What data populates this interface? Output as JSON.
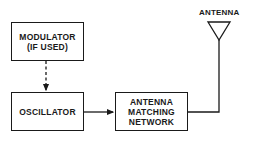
{
  "diagram": {
    "type": "block-diagram",
    "blocks": [
      {
        "id": "modulator",
        "lines": [
          "MODULATOR",
          "(IF USED)"
        ]
      },
      {
        "id": "oscillator",
        "lines": [
          "OSCILLATOR"
        ]
      },
      {
        "id": "matching_network",
        "lines": [
          "ANTENNA",
          "MATCHING",
          "NETWORK"
        ]
      }
    ],
    "antenna": {
      "label": "ANTENNA"
    },
    "connections": [
      {
        "from": "modulator",
        "to": "oscillator",
        "style": "dashed-arrow"
      },
      {
        "from": "oscillator",
        "to": "matching_network",
        "style": "solid-arrow"
      },
      {
        "from": "matching_network",
        "to": "antenna",
        "style": "solid-line"
      }
    ],
    "colors": {
      "line": "#1a1a1a",
      "background": "#ffffff"
    }
  }
}
